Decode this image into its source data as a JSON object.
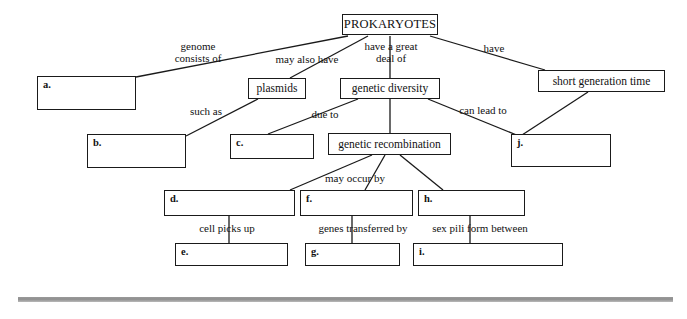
{
  "diagram": {
    "title": "PROKARYOTES",
    "type": "concept-map",
    "nodes": [
      {
        "id": "root",
        "label": "PROKARYOTES",
        "blank": false,
        "x": 342,
        "y": 14,
        "w": 96,
        "h": 21
      },
      {
        "id": "a",
        "label": "a.",
        "blank": true,
        "x": 37,
        "y": 76,
        "w": 99,
        "h": 34
      },
      {
        "id": "plasmids",
        "label": "plasmids",
        "blank": false,
        "x": 248,
        "y": 78,
        "w": 58,
        "h": 21
      },
      {
        "id": "gdiv",
        "label": "genetic diversity",
        "blank": false,
        "x": 340,
        "y": 78,
        "w": 100,
        "h": 21
      },
      {
        "id": "sgt",
        "label": "short generation time",
        "blank": false,
        "x": 538,
        "y": 70,
        "w": 127,
        "h": 22
      },
      {
        "id": "b",
        "label": "b.",
        "blank": true,
        "x": 87,
        "y": 134,
        "w": 99,
        "h": 34
      },
      {
        "id": "c",
        "label": "c.",
        "blank": true,
        "x": 230,
        "y": 134,
        "w": 84,
        "h": 25
      },
      {
        "id": "grec",
        "label": "genetic recombination",
        "blank": false,
        "x": 328,
        "y": 133,
        "w": 123,
        "h": 22
      },
      {
        "id": "j",
        "label": "j.",
        "blank": true,
        "x": 511,
        "y": 134,
        "w": 100,
        "h": 33
      },
      {
        "id": "d",
        "label": "d.",
        "blank": true,
        "x": 164,
        "y": 190,
        "w": 131,
        "h": 26
      },
      {
        "id": "f",
        "label": "f.",
        "blank": true,
        "x": 300,
        "y": 190,
        "w": 113,
        "h": 26
      },
      {
        "id": "h",
        "label": "h.",
        "blank": true,
        "x": 418,
        "y": 190,
        "w": 107,
        "h": 26
      },
      {
        "id": "e",
        "label": "e.",
        "blank": true,
        "x": 175,
        "y": 243,
        "w": 113,
        "h": 23
      },
      {
        "id": "g",
        "label": "g.",
        "blank": true,
        "x": 305,
        "y": 243,
        "w": 95,
        "h": 23
      },
      {
        "id": "i",
        "label": "i.",
        "blank": true,
        "x": 413,
        "y": 243,
        "w": 150,
        "h": 23
      }
    ],
    "link_labels": [
      {
        "id": "genome-consists-of",
        "text": "genome\nconsists of",
        "x": 150,
        "y": 40,
        "w": 96
      },
      {
        "id": "may-also-have",
        "text": "may also have",
        "x": 262,
        "y": 53,
        "w": 90
      },
      {
        "id": "have-a-great-deal-of",
        "text": "have a great\ndeal of",
        "x": 348,
        "y": 40,
        "w": 86
      },
      {
        "id": "have",
        "text": "have",
        "x": 476,
        "y": 42,
        "w": 36
      },
      {
        "id": "such-as",
        "text": "such as",
        "x": 180,
        "y": 105,
        "w": 52
      },
      {
        "id": "due-to",
        "text": "due to",
        "x": 302,
        "y": 108,
        "w": 46
      },
      {
        "id": "can-lead-to",
        "text": "can lead to",
        "x": 447,
        "y": 104,
        "w": 72
      },
      {
        "id": "may-occur-by",
        "text": "may occur by",
        "x": 311,
        "y": 172,
        "w": 88
      },
      {
        "id": "cell-picks-up",
        "text": "cell picks up",
        "x": 183,
        "y": 222,
        "w": 88
      },
      {
        "id": "genes-transferred-by",
        "text": "genes transferred by",
        "x": 298,
        "y": 222,
        "w": 130
      },
      {
        "id": "sex-pili-form-between",
        "text": "sex pili form between",
        "x": 412,
        "y": 222,
        "w": 136
      }
    ],
    "connectors": [
      {
        "id": "root-to-a",
        "from": "root",
        "to": "a",
        "points": "348,36 136,77"
      },
      {
        "id": "root-to-plasmids",
        "from": "root",
        "to": "plasmids",
        "points": "368,36 290,78"
      },
      {
        "id": "root-to-gdiv",
        "from": "root",
        "to": "gdiv",
        "points": "390,36 390,78"
      },
      {
        "id": "root-to-sgt",
        "from": "root",
        "to": "sgt",
        "points": "430,36 545,70"
      },
      {
        "id": "plasmids-to-b",
        "from": "plasmids",
        "to": "b",
        "points": "258,99 186,136"
      },
      {
        "id": "gdiv-to-c",
        "from": "gdiv",
        "to": "c",
        "points": "358,99 268,134"
      },
      {
        "id": "gdiv-to-grec",
        "from": "gdiv",
        "to": "grec",
        "points": "390,99 390,133"
      },
      {
        "id": "gdiv-to-j",
        "from": "gdiv",
        "to": "j",
        "points": "428,99 519,136"
      },
      {
        "id": "sgt-to-j",
        "from": "sgt",
        "to": "j",
        "points": "588,92 522,135"
      },
      {
        "id": "grec-to-d",
        "from": "grec",
        "to": "d",
        "points": "372,155 290,190"
      },
      {
        "id": "grec-to-f",
        "from": "grec",
        "to": "f",
        "points": "385,155 365,190"
      },
      {
        "id": "grec-to-h",
        "from": "grec",
        "to": "h",
        "points": "400,155 443,190"
      },
      {
        "id": "d-to-e",
        "from": "d",
        "to": "e",
        "points": "229,216 229,243"
      },
      {
        "id": "f-to-g",
        "from": "f",
        "to": "g",
        "points": "352,216 352,243"
      },
      {
        "id": "h-to-i",
        "from": "h",
        "to": "i",
        "points": "470,216 470,243"
      }
    ],
    "footer_rule": true
  }
}
